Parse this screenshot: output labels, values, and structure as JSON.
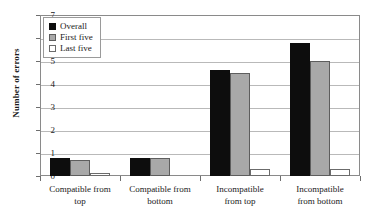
{
  "chart_data": {
    "type": "bar",
    "title": "",
    "xlabel": "",
    "ylabel": "Number of errors",
    "ylim": [
      0,
      7
    ],
    "ytick_labels": [
      "0",
      "1",
      "2",
      "3",
      "4",
      "5",
      "6",
      "7"
    ],
    "grid": true,
    "legend_position": "top-left",
    "categories": [
      "Compatible from top",
      "Compatible from bottom",
      "Incompatible from top",
      "Incompatible from bottom"
    ],
    "category_lines": [
      [
        "Compatible from",
        "top"
      ],
      [
        "Compatible from",
        "bottom"
      ],
      [
        "Incompatible",
        "from top"
      ],
      [
        "Incompatible",
        "from bottom"
      ]
    ],
    "series": [
      {
        "name": "Overall",
        "color": "#0d0d0d",
        "values": [
          0.8,
          0.8,
          4.6,
          5.8
        ]
      },
      {
        "name": "First five",
        "color": "#a9a9a9",
        "values": [
          0.7,
          0.8,
          4.5,
          5.0
        ]
      },
      {
        "name": "Last five",
        "color": "#ffffff",
        "values": [
          0.15,
          0.0,
          0.3,
          0.3
        ]
      }
    ]
  },
  "legend": {
    "items": [
      {
        "label": "Overall",
        "swatch": "black-square-icon"
      },
      {
        "label": "First five",
        "swatch": "gray-square-icon"
      },
      {
        "label": "Last five",
        "swatch": "white-square-icon"
      }
    ]
  }
}
